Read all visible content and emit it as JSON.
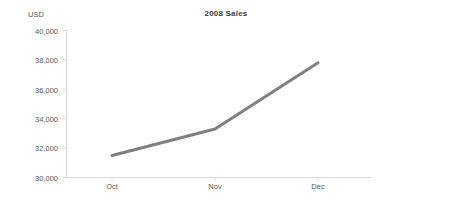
{
  "chart_data": {
    "type": "line",
    "title": "2008 Sales",
    "xlabel": "",
    "ylabel": "USD",
    "categories": [
      "Oct",
      "Nov",
      "Dec"
    ],
    "series": [
      {
        "name": "2008 Sales",
        "values": [
          31500,
          33300,
          37800
        ],
        "color": "#808080"
      }
    ],
    "ylim": [
      30000,
      40000
    ],
    "ytick_values": [
      30000,
      32000,
      34000,
      36000,
      38000,
      40000
    ],
    "ytick_labels": [
      "30,000",
      "32,000",
      "34,000",
      "36,000",
      "38,000",
      "40,000"
    ],
    "xtick_labels": [
      "Oct",
      "Nov",
      "Dec"
    ],
    "grid": false,
    "legend": "none",
    "axis_color": "#d9d9d9",
    "text_color": "#595959",
    "title_color": "#404040",
    "background": "#ffffff"
  },
  "labels": {
    "title": "2008 Sales",
    "y_axis_title": "USD",
    "y_40000": "40,000",
    "y_38000": "38,000",
    "y_36000": "36,000",
    "y_34000": "34,000",
    "y_32000": "32,000",
    "y_30000": "30,000",
    "x_oct": "Oct",
    "x_nov": "Nov",
    "x_dec": "Dec"
  }
}
